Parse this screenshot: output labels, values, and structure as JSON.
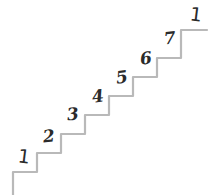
{
  "figure": {
    "kind": "staircase-counting-diagram",
    "width": 213,
    "height": 195,
    "background_color": "#ffffff",
    "line_color": "#b9b9b9",
    "line_width": 2.2,
    "label_color": "#2b2b2b"
  },
  "chart_data": {
    "type": "line",
    "title": "",
    "xlabel": "",
    "ylabel": "",
    "grid": false,
    "legend": "none",
    "xlim": [
      0,
      213
    ],
    "ylim": [
      0,
      195
    ],
    "series": [
      {
        "name": "staircase-path",
        "points": [
          [
            13,
            195
          ],
          [
            13,
            172
          ],
          [
            37,
            172
          ],
          [
            37,
            153
          ],
          [
            61,
            153
          ],
          [
            61,
            134
          ],
          [
            85,
            134
          ],
          [
            85,
            115
          ],
          [
            109,
            115
          ],
          [
            109,
            96
          ],
          [
            133,
            96
          ],
          [
            133,
            77
          ],
          [
            157,
            77
          ],
          [
            157,
            58
          ],
          [
            181,
            58
          ],
          [
            181,
            30
          ],
          [
            207,
            30
          ]
        ]
      }
    ]
  },
  "labels": [
    {
      "id": "label-1-start",
      "text": "1",
      "glyph": "tick",
      "x": 18,
      "y": 147
    },
    {
      "id": "label-2",
      "text": "2",
      "glyph": "numeral",
      "x": 43,
      "y": 128
    },
    {
      "id": "label-3",
      "text": "3",
      "glyph": "numeral",
      "x": 67,
      "y": 106
    },
    {
      "id": "label-4",
      "text": "4",
      "glyph": "numeral",
      "x": 92,
      "y": 88
    },
    {
      "id": "label-5",
      "text": "5",
      "glyph": "numeral",
      "x": 116,
      "y": 69
    },
    {
      "id": "label-6",
      "text": "6",
      "glyph": "numeral",
      "x": 140,
      "y": 50
    },
    {
      "id": "label-7",
      "text": "7",
      "glyph": "numeral",
      "x": 164,
      "y": 30
    },
    {
      "id": "label-1-end",
      "text": "1",
      "glyph": "tick",
      "x": 190,
      "y": 5
    }
  ]
}
